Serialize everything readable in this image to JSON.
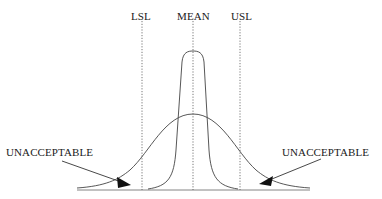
{
  "diagram": {
    "type": "process-capability-distribution",
    "labels": {
      "lsl": "LSL",
      "mean": "MEAN",
      "usl": "USL",
      "left_region": "UNACCEPTABLE",
      "right_region": "UNACCEPTABLE"
    },
    "curves": [
      {
        "name": "narrow-distribution",
        "description": "tall, narrow curve within spec limits"
      },
      {
        "name": "wide-distribution",
        "description": "wide curve with tails beyond LSL and USL"
      }
    ],
    "colors": {
      "line": "#333333",
      "background": "#ffffff"
    }
  }
}
